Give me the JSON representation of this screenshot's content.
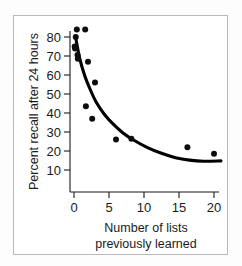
{
  "chart_data": {
    "type": "scatter",
    "title": "",
    "xlabel": "Number of lists previously learned",
    "xlabel_line1": "Number of lists",
    "xlabel_line2": "previously learned",
    "ylabel": "Percent recall after 24 hours",
    "xlim": [
      -0.9,
      21.5
    ],
    "ylim": [
      5,
      88
    ],
    "grid": false,
    "legend": null,
    "xticks": [
      0,
      5,
      10,
      15,
      20
    ],
    "xtick_labels": [
      "0",
      "5",
      "10",
      "15",
      "20"
    ],
    "yticks": [
      10,
      20,
      30,
      40,
      50,
      60,
      70,
      80
    ],
    "ytick_labels": [
      "10",
      "20",
      "30",
      "40",
      "50",
      "60",
      "70",
      "80"
    ],
    "point_color": "#0d0d0d",
    "curve_color": "#000000",
    "points": [
      {
        "x": 0.4,
        "y": 84.0
      },
      {
        "x": 1.6,
        "y": 84.0
      },
      {
        "x": 0.25,
        "y": 80.0
      },
      {
        "x": 0.1,
        "y": 75.0
      },
      {
        "x": 0.15,
        "y": 74.0
      },
      {
        "x": 0.5,
        "y": 70.5
      },
      {
        "x": 0.55,
        "y": 68.5
      },
      {
        "x": 2.0,
        "y": 67.0
      },
      {
        "x": 3.0,
        "y": 56.0
      },
      {
        "x": 1.7,
        "y": 43.5
      },
      {
        "x": 2.6,
        "y": 37.0
      },
      {
        "x": 6.0,
        "y": 26.0
      },
      {
        "x": 8.2,
        "y": 26.5
      },
      {
        "x": 16.2,
        "y": 22.0
      },
      {
        "x": 20.0,
        "y": 18.5
      }
    ],
    "fit_curve": [
      {
        "x": 0.25,
        "y": 79.5
      },
      {
        "x": 0.8,
        "y": 69.0
      },
      {
        "x": 1.5,
        "y": 60.0
      },
      {
        "x": 2.3,
        "y": 52.5
      },
      {
        "x": 3.2,
        "y": 45.5
      },
      {
        "x": 4.3,
        "y": 39.5
      },
      {
        "x": 5.5,
        "y": 34.5
      },
      {
        "x": 7.0,
        "y": 29.5
      },
      {
        "x": 8.5,
        "y": 25.8
      },
      {
        "x": 10.5,
        "y": 21.8
      },
      {
        "x": 12.5,
        "y": 18.8
      },
      {
        "x": 14.5,
        "y": 16.5
      },
      {
        "x": 16.5,
        "y": 15.2
      },
      {
        "x": 18.5,
        "y": 14.6
      },
      {
        "x": 21.0,
        "y": 14.8
      }
    ]
  }
}
